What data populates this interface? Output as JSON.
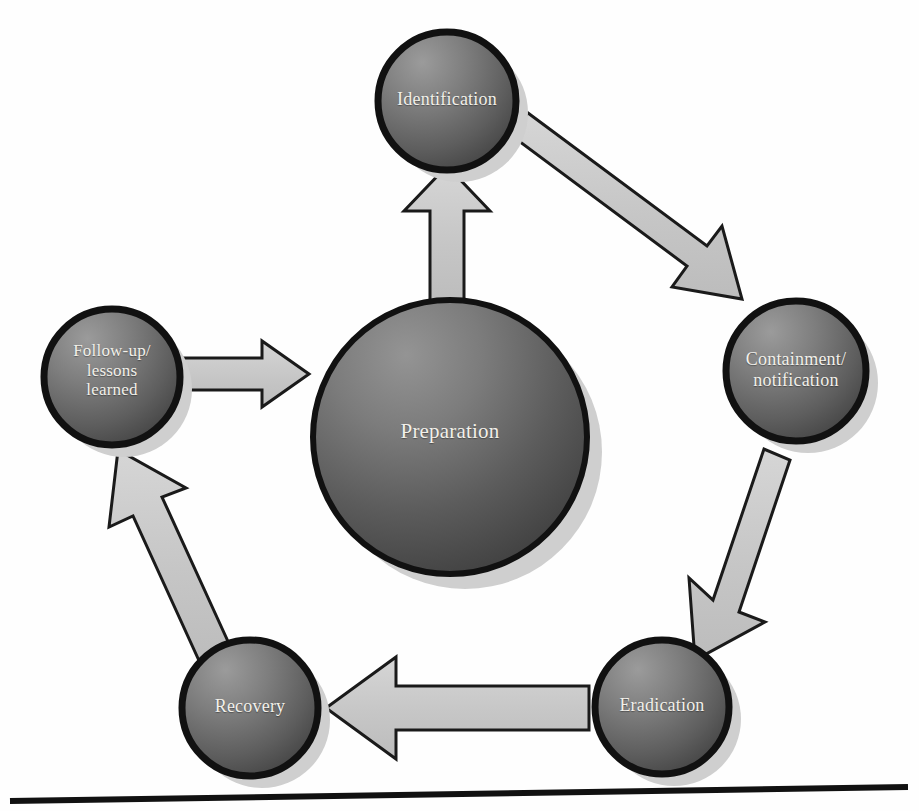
{
  "diagram": {
    "type": "cycle-diagram",
    "background_color": "#fefefe",
    "node_fill_light": "#8f8f8f",
    "node_fill_dark": "#4a4a4a",
    "node_stroke_color": "#121212",
    "node_text_color": "#f2f0ea",
    "arrow_fill_color": "#c9c9c9",
    "arrow_stroke_color": "#1a1a1a",
    "shadow_color": "#cfcfcf",
    "baseline_color": "#111111",
    "nodes": [
      {
        "id": "preparation",
        "label": "Preparation",
        "cx": 450,
        "cy": 437,
        "r": 137,
        "font_size": 21,
        "label_offset_y": -10
      },
      {
        "id": "identification",
        "label": "Identification",
        "cx": 447,
        "cy": 101,
        "r": 69,
        "font_size": 18,
        "label_offset_y": 0
      },
      {
        "id": "containment-notification",
        "label": "Containment/\nnotification",
        "cx": 796,
        "cy": 371,
        "r": 70,
        "font_size": 18,
        "label_offset_y": 0
      },
      {
        "id": "eradication",
        "label": "Eradication",
        "cx": 662,
        "cy": 707,
        "r": 67,
        "font_size": 18,
        "label_offset_y": 0
      },
      {
        "id": "recovery",
        "label": "Recovery",
        "cx": 250,
        "cy": 708,
        "r": 68,
        "font_size": 18,
        "label_offset_y": 0
      },
      {
        "id": "follow-up-lessons-learned",
        "label": "Follow-up/\nlessons\nlearned",
        "cx": 112,
        "cy": 377,
        "r": 68,
        "font_size": 17,
        "label_offset_y": 0
      }
    ],
    "arrows": [
      {
        "id": "preparation-to-identification",
        "from": "preparation",
        "to": "identification",
        "direction": "up",
        "label": ""
      },
      {
        "id": "identification-to-containment",
        "from": "identification",
        "to": "containment-notification",
        "direction": "down-right",
        "label": ""
      },
      {
        "id": "containment-to-eradication",
        "from": "containment-notification",
        "to": "eradication",
        "direction": "down",
        "label": ""
      },
      {
        "id": "eradication-to-recovery",
        "from": "eradication",
        "to": "recovery",
        "direction": "left",
        "label": ""
      },
      {
        "id": "recovery-to-follow-up",
        "from": "recovery",
        "to": "follow-up-lessons-learned",
        "direction": "up-left",
        "label": ""
      },
      {
        "id": "follow-up-to-preparation",
        "from": "follow-up-lessons-learned",
        "to": "preparation",
        "direction": "right",
        "label": ""
      }
    ],
    "baseline": {
      "x1": 10,
      "y1": 801,
      "x2": 908,
      "y2": 787,
      "thickness": 6
    }
  }
}
